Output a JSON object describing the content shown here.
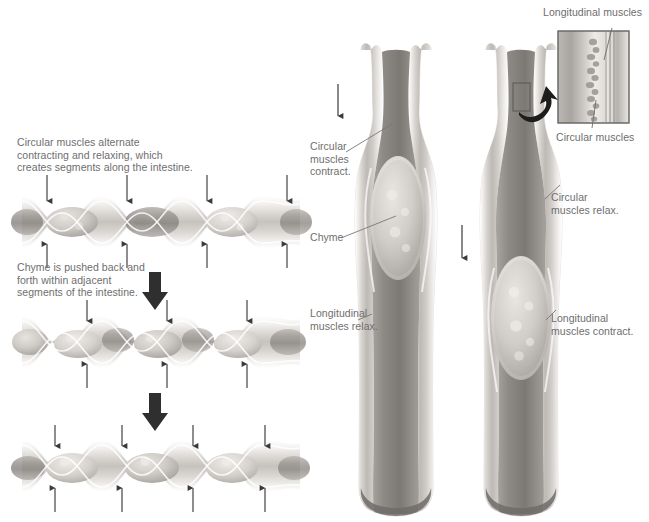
{
  "figure": {
    "title_present": false,
    "background_color": "#ffffff",
    "label_color": "#6e6e6e",
    "arrow_color": "#3a3a3a",
    "leader_color": "#808080",
    "tissue_colors": {
      "serosa_light": "#f2f0ee",
      "muscle_mid": "#c9c6c2",
      "muscle_dark": "#8e8a86",
      "lumen_dark": "#7d7976",
      "chyme_light": "#d9d6d2"
    }
  },
  "segmentation_panel": {
    "name": "segmentation-sequence",
    "captions": [
      {
        "id": "caption-circular-muscles",
        "text": "Circular muscles alternate\ncontracting and relaxing, which\ncreates segments along the intestine."
      },
      {
        "id": "caption-chyme-pushed",
        "text": "Chyme is pushed back and\nforth within adjacent\nsegments of the intestine."
      }
    ],
    "stages": [
      {
        "id": "segmentation-stage-1",
        "constriction_arrow_pairs": 4
      },
      {
        "id": "segmentation-stage-2",
        "constriction_arrow_pairs": 3
      },
      {
        "id": "segmentation-stage-3",
        "constriction_arrow_pairs": 4
      }
    ],
    "progress_arrows": 2
  },
  "peristalsis_panel": {
    "name": "peristalsis-sequence",
    "labels": [
      {
        "id": "label-circular-muscles-contract",
        "text": "Circular\nmuscles\ncontract."
      },
      {
        "id": "label-chyme",
        "text": "Chyme"
      },
      {
        "id": "label-longitudinal-muscles-relax",
        "text": "Longitudinal\nmuscles relax."
      },
      {
        "id": "label-circular-muscles-relax",
        "text": "Circular\nmuscles relax."
      },
      {
        "id": "label-longitudinal-muscles-contract",
        "text": "Longitudinal\nmuscles contract."
      }
    ],
    "direction_arrows": 2
  },
  "inset_panel": {
    "name": "muscle-layer-inset",
    "labels": [
      {
        "id": "label-longitudinal-muscles",
        "text": "Longitudinal muscles"
      },
      {
        "id": "label-circular-muscles",
        "text": "Circular muscles"
      }
    ],
    "callout_box_present": true,
    "magnify_arrow_present": true
  }
}
